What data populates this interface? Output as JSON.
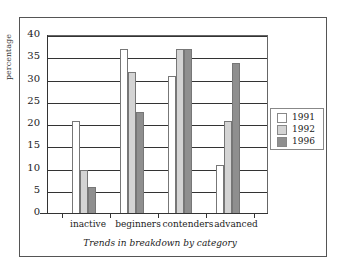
{
  "chart_data": {
    "type": "bar",
    "title": "",
    "xlabel": "Trends in breakdown by category",
    "ylabel": "percentage",
    "ylim": [
      0,
      40
    ],
    "yticks": [
      0,
      5,
      10,
      15,
      20,
      25,
      30,
      35,
      40
    ],
    "categories": [
      "inactive",
      "beginners",
      "contenders",
      "advanced"
    ],
    "series": [
      {
        "name": "1991",
        "color": "#ffffff",
        "values": [
          21,
          37,
          31,
          11
        ]
      },
      {
        "name": "1992",
        "color": "#d4d4d4",
        "values": [
          10,
          32,
          37,
          21
        ]
      },
      {
        "name": "1996",
        "color": "#8f8f8f",
        "values": [
          6,
          23,
          37,
          34
        ]
      }
    ],
    "legend_position": "right",
    "grid": true
  },
  "labels": {
    "ylabel": "percentage",
    "xtitle": "Trends in breakdown by category",
    "cat0": "inactive",
    "cat1": "beginners",
    "cat2": "contenders",
    "cat3": "advanced",
    "leg0": "1991",
    "leg1": "1992",
    "leg2": "1996"
  }
}
